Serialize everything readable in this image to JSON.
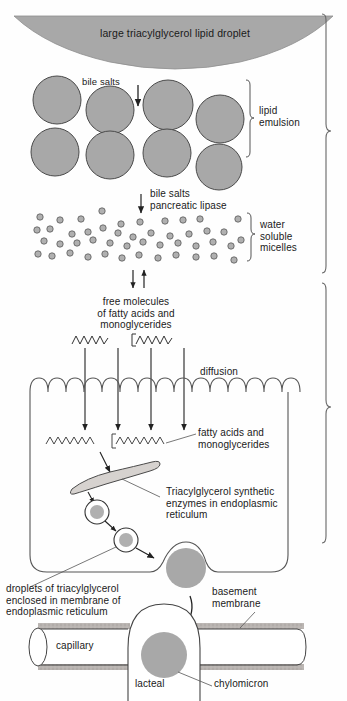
{
  "figure": {
    "width": 347,
    "height": 701,
    "colors": {
      "fill_gray": "#a8a8a8",
      "stroke": "#333333",
      "text": "#1a1a1a",
      "background": "#ffffff",
      "membrane_gray": "#b5b0ad"
    }
  },
  "labels": {
    "lipid_droplet": "large triacylglycerol lipid droplet",
    "bile_salts": "bile salts",
    "lipid_emulsion": "lipid\nemulsion",
    "bile_salts_lipase": "bile salts\npancreatic lipase",
    "water_soluble_micelles": "water\nsoluble\nmicelles",
    "free_molecules": "free molecules\nof fatty acids and\nmonoglycerides",
    "diffusion": "diffusion",
    "fatty_acids_mono": "fatty acids and\nmonoglycerides",
    "tag_enzymes": "Triacylglycerol synthetic\nenzymes in endoplasmic\nreticulum",
    "droplets_tag": "droplets of triacylglycerol\nenclosed in membrane of\nendoplasmic reticulum",
    "basement_membrane": "basement\nmembrane",
    "capillary": "capillary",
    "lacteal": "lacteal",
    "chylomicron": "chylomicron"
  },
  "stages": [
    {
      "name": "lipid-emulsion",
      "label": "lipid emulsion",
      "bracket": "right-inner"
    },
    {
      "name": "water-soluble-micelles",
      "label": "water soluble micelles",
      "bracket": "right-inner"
    }
  ],
  "counts": {
    "emulsion_droplets": 8,
    "micelle_dots": 46,
    "microvilli": 14,
    "diffusion_arrows": 4,
    "er_vesicles": 2,
    "chylomicrons": 2
  },
  "icons": {
    "down_arrow": "down-arrow-icon",
    "equilibrium": "equilibrium-arrows-icon",
    "fatty_acid": "zigzag-fatty-acid-icon",
    "monoglyceride": "zigzag-monoglyceride-icon",
    "bracket": "curly-bracket-icon"
  }
}
